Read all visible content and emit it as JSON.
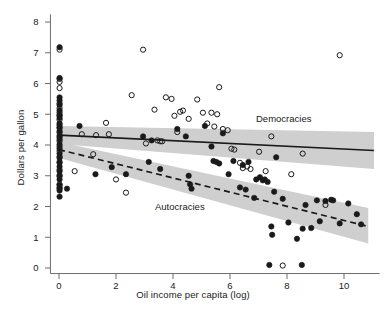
{
  "figure": {
    "title": "",
    "xlabel": "Oil income per capita (log)",
    "ylabel": "Dollars per gallon",
    "series_labels": {
      "democracies": "Democracies",
      "autocracies": "Autocracies"
    }
  },
  "chart_data": {
    "type": "scatter",
    "title": "",
    "xlabel": "Oil income per capita (log)",
    "ylabel": "Dollars per gallon",
    "xlim": [
      -0.35,
      11.3
    ],
    "ylim": [
      -0.35,
      8.35
    ],
    "xticks": [
      0,
      2,
      4,
      6,
      8,
      10
    ],
    "yticks": [
      0,
      1,
      2,
      3,
      4,
      5,
      6,
      7,
      8
    ],
    "grid": false,
    "legend": "inline-annotations",
    "annotations": [
      {
        "text": "Democracies",
        "x": 7.0,
        "y": 4.85
      },
      {
        "text": "Autocracies",
        "x": 3.45,
        "y": 1.95
      }
    ],
    "series": [
      {
        "name": "Democracies",
        "marker": "open-circle",
        "color": "#1a1a1a",
        "fill": "none",
        "points": [
          [
            0.02,
            7.1
          ],
          [
            0.02,
            6.15
          ],
          [
            0.02,
            6.05
          ],
          [
            0.02,
            5.85
          ],
          [
            0.02,
            5.35
          ],
          [
            0.02,
            5.2
          ],
          [
            0.02,
            5.05
          ],
          [
            0.02,
            4.95
          ],
          [
            0.02,
            4.82
          ],
          [
            0.02,
            4.65
          ],
          [
            0.02,
            4.55
          ],
          [
            0.02,
            4.4
          ],
          [
            0.02,
            4.25
          ],
          [
            0.02,
            4.12
          ],
          [
            0.02,
            3.95
          ],
          [
            0.02,
            3.8
          ],
          [
            0.02,
            3.62
          ],
          [
            0.02,
            3.42
          ],
          [
            0.02,
            3.2
          ],
          [
            0.02,
            2.98
          ],
          [
            0.02,
            2.72
          ],
          [
            0.02,
            2.58
          ],
          [
            0.55,
            3.15
          ],
          [
            0.8,
            4.35
          ],
          [
            1.3,
            4.32
          ],
          [
            1.2,
            3.7
          ],
          [
            1.65,
            4.72
          ],
          [
            1.75,
            4.35
          ],
          [
            2.0,
            2.88
          ],
          [
            2.35,
            2.45
          ],
          [
            2.55,
            5.62
          ],
          [
            2.95,
            7.1
          ],
          [
            3.05,
            4.05
          ],
          [
            3.35,
            5.15
          ],
          [
            3.45,
            4.15
          ],
          [
            3.55,
            4.12
          ],
          [
            3.62,
            4.12
          ],
          [
            3.75,
            5.55
          ],
          [
            3.95,
            5.5
          ],
          [
            4.05,
            4.95
          ],
          [
            4.15,
            4.42
          ],
          [
            4.25,
            5.08
          ],
          [
            4.35,
            5.12
          ],
          [
            4.55,
            4.85
          ],
          [
            4.85,
            5.48
          ],
          [
            5.05,
            5.05
          ],
          [
            5.2,
            4.7
          ],
          [
            5.35,
            5.05
          ],
          [
            5.45,
            4.6
          ],
          [
            5.55,
            5.0
          ],
          [
            5.62,
            5.88
          ],
          [
            5.75,
            4.52
          ],
          [
            5.92,
            4.48
          ],
          [
            6.05,
            3.88
          ],
          [
            6.15,
            3.85
          ],
          [
            6.35,
            3.42
          ],
          [
            6.45,
            3.25
          ],
          [
            6.6,
            3.3
          ],
          [
            6.72,
            3.22
          ],
          [
            7.02,
            3.78
          ],
          [
            7.25,
            3.15
          ],
          [
            7.45,
            4.28
          ],
          [
            7.85,
            0.08
          ],
          [
            8.15,
            3.05
          ],
          [
            8.55,
            3.72
          ],
          [
            9.35,
            2.05
          ],
          [
            9.85,
            6.92
          ]
        ]
      },
      {
        "name": "Autocracies",
        "marker": "filled-circle",
        "color": "#1a1a1a",
        "fill": "#1a1a1a",
        "points": [
          [
            0.02,
            7.18
          ],
          [
            0.02,
            6.18
          ],
          [
            0.02,
            5.55
          ],
          [
            0.02,
            5.45
          ],
          [
            0.02,
            5.3
          ],
          [
            0.02,
            5.12
          ],
          [
            0.02,
            4.98
          ],
          [
            0.02,
            4.88
          ],
          [
            0.02,
            4.7
          ],
          [
            0.02,
            4.58
          ],
          [
            0.02,
            4.45
          ],
          [
            0.02,
            4.3
          ],
          [
            0.02,
            4.18
          ],
          [
            0.02,
            4.02
          ],
          [
            0.02,
            3.88
          ],
          [
            0.02,
            3.72
          ],
          [
            0.02,
            3.58
          ],
          [
            0.02,
            3.45
          ],
          [
            0.02,
            3.3
          ],
          [
            0.02,
            3.15
          ],
          [
            0.02,
            3.02
          ],
          [
            0.02,
            2.88
          ],
          [
            0.02,
            2.7
          ],
          [
            0.02,
            2.62
          ],
          [
            0.02,
            2.52
          ],
          [
            0.02,
            2.32
          ],
          [
            0.28,
            2.58
          ],
          [
            0.72,
            4.62
          ],
          [
            1.28,
            3.05
          ],
          [
            1.85,
            3.28
          ],
          [
            2.35,
            3.05
          ],
          [
            2.95,
            4.28
          ],
          [
            3.15,
            3.45
          ],
          [
            3.25,
            4.15
          ],
          [
            3.55,
            3.22
          ],
          [
            4.15,
            4.52
          ],
          [
            4.45,
            4.28
          ],
          [
            4.55,
            3.0
          ],
          [
            4.6,
            2.72
          ],
          [
            4.65,
            2.58
          ],
          [
            5.12,
            4.62
          ],
          [
            5.35,
            3.95
          ],
          [
            5.42,
            3.48
          ],
          [
            5.52,
            3.45
          ],
          [
            5.62,
            3.4
          ],
          [
            5.75,
            4.38
          ],
          [
            5.95,
            3.05
          ],
          [
            6.12,
            3.48
          ],
          [
            6.35,
            2.62
          ],
          [
            6.45,
            3.35
          ],
          [
            6.55,
            2.55
          ],
          [
            6.65,
            3.45
          ],
          [
            6.85,
            2.28
          ],
          [
            6.92,
            2.88
          ],
          [
            7.05,
            2.95
          ],
          [
            7.15,
            2.85
          ],
          [
            7.22,
            2.88
          ],
          [
            7.32,
            2.8
          ],
          [
            7.38,
            0.1
          ],
          [
            7.45,
            1.35
          ],
          [
            7.48,
            1.08
          ],
          [
            7.55,
            2.48
          ],
          [
            7.62,
            3.6
          ],
          [
            7.85,
            2.25
          ],
          [
            8.05,
            1.48
          ],
          [
            8.35,
            0.95
          ],
          [
            8.52,
            0.1
          ],
          [
            8.55,
            1.28
          ],
          [
            8.65,
            2.05
          ],
          [
            8.85,
            1.3
          ],
          [
            9.05,
            2.2
          ],
          [
            9.15,
            1.52
          ],
          [
            9.35,
            2.18
          ],
          [
            9.55,
            2.22
          ],
          [
            9.62,
            2.2
          ],
          [
            9.85,
            1.45
          ],
          [
            10.15,
            2.1
          ],
          [
            10.45,
            1.75
          ],
          [
            10.6,
            1.42
          ]
        ]
      }
    ],
    "fits": [
      {
        "name": "Democracies",
        "style": "solid",
        "color": "#1a1a1a",
        "line": {
          "x0": 0.0,
          "y0": 4.32,
          "x1": 11.05,
          "y1": 3.82
        },
        "band": {
          "x0": 0.0,
          "x1": 11.05,
          "upper0": 4.62,
          "lower0": 4.03,
          "upper1": 4.42,
          "lower1": 3.22
        }
      },
      {
        "name": "Autocracies",
        "style": "dashed",
        "color": "#1a1a1a",
        "line": {
          "x0": 0.0,
          "y0": 3.85,
          "x1": 10.85,
          "y1": 1.35
        },
        "band": {
          "x0": 0.0,
          "x1": 10.85,
          "upper0": 4.1,
          "lower0": 3.58,
          "upper1": 1.95,
          "lower1": 0.8
        }
      }
    ]
  }
}
